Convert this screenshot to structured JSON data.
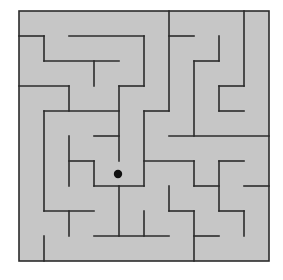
{
  "maze": {
    "rows": 10,
    "cols": 10,
    "origin": [
      19,
      11
    ],
    "cell_size": 25,
    "colors": {
      "floor": "#c6c6c6",
      "wall": "#2b2b2b",
      "player": "#111111",
      "page": "#ffffff"
    },
    "player": {
      "x": 118,
      "y": 174,
      "r": 4.2
    },
    "h_walls": [
      [
        1,
        0,
        1
      ],
      [
        1,
        2,
        5
      ],
      [
        1,
        6,
        7
      ],
      [
        2,
        1,
        4
      ],
      [
        2,
        7,
        8
      ],
      [
        3,
        0,
        2
      ],
      [
        3,
        4,
        5
      ],
      [
        3,
        8,
        9
      ],
      [
        4,
        1,
        4
      ],
      [
        4,
        5,
        6
      ],
      [
        4,
        8,
        9
      ],
      [
        5,
        3,
        4
      ],
      [
        5,
        6,
        10
      ],
      [
        6,
        2,
        3
      ],
      [
        6,
        5,
        7
      ],
      [
        6,
        8,
        9
      ],
      [
        7,
        3,
        5
      ],
      [
        7,
        7,
        8
      ],
      [
        7,
        9,
        10
      ],
      [
        8,
        1,
        3
      ],
      [
        8,
        6,
        7
      ],
      [
        8,
        8,
        9
      ],
      [
        9,
        3,
        6
      ],
      [
        9,
        7,
        8
      ]
    ],
    "v_walls": [
      [
        1,
        1,
        2
      ],
      [
        1,
        4,
        8
      ],
      [
        1,
        9,
        10
      ],
      [
        2,
        3,
        4
      ],
      [
        2,
        5,
        7
      ],
      [
        2,
        8,
        9
      ],
      [
        3,
        2,
        3
      ],
      [
        3,
        6,
        7
      ],
      [
        4,
        3,
        6
      ],
      [
        4,
        7,
        9
      ],
      [
        5,
        1,
        3
      ],
      [
        5,
        4,
        7
      ],
      [
        5,
        8,
        9
      ],
      [
        6,
        0,
        4
      ],
      [
        6,
        7,
        8
      ],
      [
        7,
        2,
        5
      ],
      [
        7,
        6,
        7
      ],
      [
        7,
        8,
        10
      ],
      [
        8,
        1,
        2
      ],
      [
        8,
        3,
        4
      ],
      [
        8,
        6,
        8
      ],
      [
        9,
        0,
        3
      ],
      [
        9,
        8,
        9
      ]
    ]
  }
}
